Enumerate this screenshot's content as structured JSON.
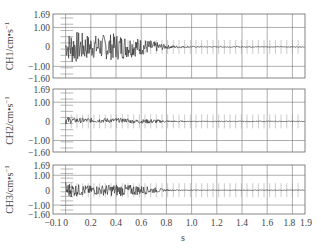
{
  "chart_data": {
    "type": "line",
    "title": "",
    "xlabel": "s",
    "xlim": [
      -0.1,
      1.9
    ],
    "x_ticks": [
      -0.1,
      0,
      0.2,
      0.4,
      0.6,
      0.8,
      1.0,
      1.2,
      1.4,
      1.6,
      1.8,
      1.9
    ],
    "x_tick_labels": [
      "-0.1",
      "0",
      "0.2",
      "0.4",
      "0.6",
      "0.8",
      "1.0",
      "1.2",
      "1.4",
      "1.6",
      "1.8",
      "1.9"
    ],
    "grid": true,
    "panels": [
      {
        "name": "CH1",
        "ylabel": "CH1/cm·s⁻¹",
        "ylim": [
          -1.6,
          1.69
        ],
        "y_ticks": [
          1.69,
          1.0,
          0,
          -1.0,
          -1.6
        ],
        "y_tick_labels": [
          "1.69",
          "1.00",
          "0",
          "-1.00",
          "-1.60"
        ],
        "description": "Strong oscillation 0–0.75 s, peak amplitude ~±0.9, decaying to near zero after ~0.8 s",
        "envelope": {
          "t": [
            0.0,
            0.05,
            0.2,
            0.4,
            0.55,
            0.7,
            0.8,
            1.0,
            1.9
          ],
          "amp": [
            0.5,
            0.9,
            0.6,
            0.7,
            0.5,
            0.3,
            0.1,
            0.03,
            0.02
          ]
        }
      },
      {
        "name": "CH2",
        "ylabel": "CH2/cm·s⁻¹",
        "ylim": [
          -1.6,
          1.69
        ],
        "y_ticks": [
          1.69,
          1.0,
          0,
          -1.0,
          -1.6
        ],
        "y_tick_labels": [
          "1.69",
          "1.00",
          "0",
          "-1.00",
          "-1.60"
        ],
        "description": "Small oscillation ~±0.15 from 0–0.8 s, slight positive offset early, near zero afterwards",
        "envelope": {
          "t": [
            0.0,
            0.05,
            0.2,
            0.4,
            0.55,
            0.7,
            0.8,
            1.0,
            1.9
          ],
          "amp": [
            0.2,
            0.15,
            0.12,
            0.12,
            0.1,
            0.12,
            0.05,
            0.02,
            0.02
          ]
        }
      },
      {
        "name": "CH3",
        "ylabel": "CH3/cm·s⁻¹",
        "ylim": [
          -1.6,
          1.69
        ],
        "y_ticks": [
          1.69,
          1.0,
          0,
          -1.0,
          -1.6
        ],
        "y_tick_labels": [
          "1.69",
          "1.00",
          "0",
          "-1.00",
          "-1.60"
        ],
        "description": "Moderate oscillation ~±0.4 from 0–0.75 s, decaying to near zero after ~0.8 s",
        "envelope": {
          "t": [
            0.0,
            0.05,
            0.2,
            0.4,
            0.55,
            0.7,
            0.8,
            1.0,
            1.9
          ],
          "amp": [
            0.6,
            0.45,
            0.3,
            0.4,
            0.35,
            0.2,
            0.05,
            0.02,
            0.02
          ]
        }
      }
    ]
  },
  "labels": {
    "xlabel": "s",
    "ch1": "CH1/cm",
    "ch2": "CH2/cm",
    "ch3": "CH3/cm",
    "unit_suffix": "•s",
    "sup": "−1"
  }
}
